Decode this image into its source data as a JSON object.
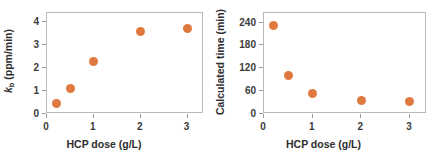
{
  "figure": {
    "background": "#ffffff",
    "marker_color": "#e0793f",
    "axis_color": "#b9b9b9",
    "text_color": "#2e2e2e"
  },
  "chart_data": [
    {
      "type": "scatter",
      "id": "left",
      "title": "",
      "xlabel": "HCP dose (g/L)",
      "ylabel": "kₑ (ppm/min)",
      "ylabel_base": "k",
      "ylabel_sub": "b",
      "ylabel_rest": " (ppm/min)",
      "xlim": [
        0,
        3.35
      ],
      "ylim": [
        0,
        4.4
      ],
      "xticks": [
        0,
        1,
        2,
        3
      ],
      "xticklabels": [
        "0",
        "1",
        "2",
        "3"
      ],
      "yticks": [
        0,
        1,
        2,
        3,
        4
      ],
      "yticklabels": [
        "0",
        "1",
        "2",
        "3",
        "4"
      ],
      "grid": false,
      "legend": null,
      "marker_color": "#e0793f",
      "x": [
        0.2,
        0.5,
        1.0,
        2.0,
        3.0
      ],
      "y": [
        0.45,
        1.1,
        2.27,
        3.58,
        3.73
      ],
      "points": [
        {
          "x": 0.2,
          "y": 0.45
        },
        {
          "x": 0.5,
          "y": 1.1
        },
        {
          "x": 1.0,
          "y": 2.27
        },
        {
          "x": 2.0,
          "y": 3.58
        },
        {
          "x": 3.0,
          "y": 3.73
        }
      ]
    },
    {
      "type": "scatter",
      "id": "right",
      "title": "",
      "xlabel": "HCP dose (g/L)",
      "ylabel": "Calculated time (min)",
      "xlim": [
        0,
        3.35
      ],
      "ylim": [
        0,
        265
      ],
      "xticks": [
        0,
        1,
        2,
        3
      ],
      "xticklabels": [
        "0",
        "1",
        "2",
        "3"
      ],
      "yticks": [
        0,
        60,
        120,
        180,
        240
      ],
      "yticklabels": [
        "0",
        "60",
        "120",
        "180",
        "240"
      ],
      "grid": false,
      "legend": null,
      "marker_color": "#e0793f",
      "x": [
        0.2,
        0.5,
        1.0,
        2.0,
        3.0
      ],
      "y": [
        233,
        100,
        54,
        35,
        32
      ],
      "points": [
        {
          "x": 0.2,
          "y": 233
        },
        {
          "x": 0.5,
          "y": 100
        },
        {
          "x": 1.0,
          "y": 54
        },
        {
          "x": 2.0,
          "y": 35
        },
        {
          "x": 3.0,
          "y": 32
        }
      ]
    }
  ]
}
